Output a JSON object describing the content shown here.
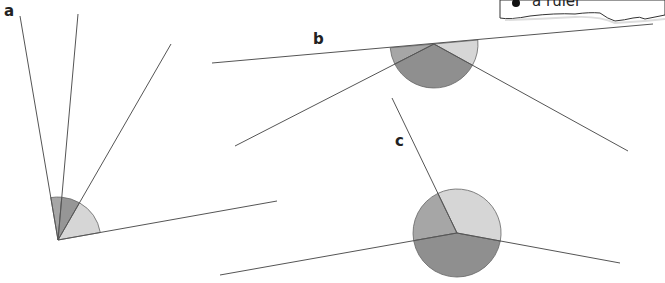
{
  "labels": {
    "a": "a",
    "b": "b",
    "c": "c"
  },
  "equipment_note": {
    "items": [
      "a ruler"
    ]
  },
  "colors": {
    "line": "#555555",
    "sector_light": "#d6d6d6",
    "sector_medium": "#a6a6a6",
    "sector_dark": "#8f8f8f",
    "arc_stroke": "#666666"
  },
  "diagrams": {
    "a": {
      "vertex": [
        58,
        240
      ],
      "radius": 43,
      "rays": [
        [
          20,
          16
        ],
        [
          78,
          14
        ],
        [
          171,
          44
        ],
        [
          277,
          201
        ]
      ],
      "sectors": [
        "medium",
        "dark",
        "light"
      ]
    },
    "b": {
      "vertex": [
        434,
        44
      ],
      "radius": 44,
      "rays": [
        [
          212,
          63
        ],
        [
          653,
          24
        ],
        [
          235,
          146
        ],
        [
          628,
          151
        ]
      ],
      "sectors": [
        "medium",
        "dark",
        "light"
      ]
    },
    "c": {
      "vertex": [
        457,
        233
      ],
      "radius": 44,
      "rays": [
        [
          392,
          98
        ],
        [
          220,
          275
        ],
        [
          620,
          263
        ]
      ],
      "sectors": [
        "medium",
        "dark",
        "light"
      ]
    }
  }
}
